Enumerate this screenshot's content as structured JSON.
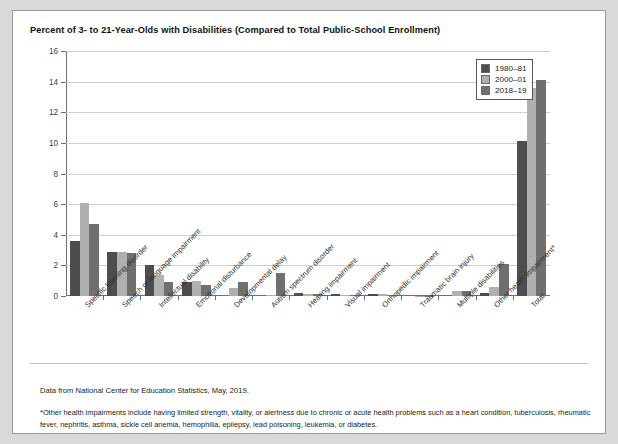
{
  "card": {
    "title": "Percent of 3- to 21-Year-Olds with Disabilities (Compared to Total Public-School Enrollment)",
    "source_note": "Data from National Center for Education Statistics, May, 2019.",
    "footnote": "*Other health impairments include having limited strength, vitality, or alertness due to chronic or acute health problems such as a heart condition, tuberculosis, rheumatic fever, nephritis, asthma, sickle cell anemia, hemophilia, epilepsy, lead poisoning, leukemia, or diabetes."
  },
  "legend": {
    "position": "top-right",
    "entries": [
      {
        "label": "1980–81",
        "color": "#4d4d4d"
      },
      {
        "label": "2000–01",
        "color": "#b0b0b0"
      },
      {
        "label": "2018–19",
        "color": "#6f6f6f"
      }
    ]
  },
  "axis": {
    "y_ticks": [
      "0",
      "2",
      "4",
      "6",
      "8",
      "10",
      "12",
      "14",
      "16"
    ]
  },
  "chart_data": {
    "type": "bar",
    "title": "Percent of 3- to 21-Year-Olds with Disabilities (Compared to Total Public-School Enrollment)",
    "xlabel": "",
    "ylabel": "",
    "ylim": [
      0,
      16
    ],
    "ytick_step": 2,
    "grid": true,
    "legend_position": "top-right",
    "categories": [
      "Specific learning disorder",
      "Speech or language impairment",
      "Intellectual disability",
      "Emotional disturbance",
      "Developmental delay",
      "Autism spectrum disorder",
      "Hearing impairment",
      "Visual impairment",
      "Orthopedic impairment",
      "Traumatic brain injury",
      "Multiple disabilities",
      "Other health impairment*",
      "Total"
    ],
    "series": [
      {
        "name": "1980–81",
        "color": "#4d4d4d",
        "values": [
          3.6,
          2.9,
          2.0,
          0.9,
          0.0,
          0.0,
          0.2,
          0.1,
          0.1,
          0.0,
          0.0,
          0.2,
          10.1
        ]
      },
      {
        "name": "2000–01",
        "color": "#b0b0b0",
        "values": [
          6.1,
          2.9,
          1.4,
          1.0,
          0.5,
          0.05,
          0.15,
          0.05,
          0.15,
          0.03,
          0.3,
          0.6,
          13.6
        ]
      },
      {
        "name": "2018–19",
        "color": "#6f6f6f",
        "values": [
          4.7,
          2.8,
          0.9,
          0.7,
          0.9,
          1.5,
          0.15,
          0.05,
          0.05,
          0.03,
          0.3,
          2.1,
          14.1
        ]
      }
    ]
  }
}
